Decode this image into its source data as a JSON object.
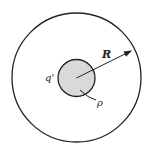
{
  "diagram": {
    "type": "concentric-circles",
    "labels": {
      "radius": "R",
      "charge": "q'",
      "density": "ρ"
    },
    "colors": {
      "stroke": "#222222",
      "inner_fill": "#d9d9d9",
      "background": "#ffffff"
    }
  }
}
